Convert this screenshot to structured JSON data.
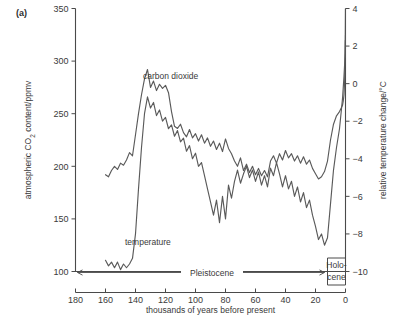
{
  "figure": {
    "panel_label": "(a)",
    "curve_labels": {
      "co2": "carbon dioxide",
      "temperature": "temperature"
    },
    "epochs": {
      "pleistocene": "Pleistocene",
      "holocene_line1": "Holo-",
      "holocene_line2": "cene"
    }
  },
  "chart_data": {
    "type": "line",
    "title": "",
    "xlabel": "thousands of years before present",
    "ylabel": "atmospheric CO2 content/ppmv",
    "y2label": "relative temperature change/°C",
    "xlim": [
      180,
      0
    ],
    "x_reversed": true,
    "ylim": [
      100,
      350
    ],
    "y2lim": [
      -10,
      4
    ],
    "grid": false,
    "legend_position": "inline-annotations",
    "xticks": [
      180,
      160,
      140,
      120,
      100,
      80,
      60,
      40,
      20,
      0
    ],
    "xticklabels": [
      "180",
      "160",
      "140",
      "120",
      "100",
      "80",
      "60",
      "40",
      "20",
      "0"
    ],
    "yticks": [
      100,
      150,
      200,
      250,
      300,
      350
    ],
    "yticklabels": [
      "100",
      "150",
      "200",
      "250",
      "300",
      "350"
    ],
    "y2ticks": [
      4,
      2,
      0,
      -2,
      -4,
      -6,
      -8,
      -10
    ],
    "y2ticklabels": [
      "4",
      "2",
      "0",
      "−2",
      "−4",
      "−6",
      "−8",
      "−10"
    ],
    "annotations": [
      {
        "text": "Pleistocene",
        "x_range": [
          178,
          12
        ],
        "type": "double-arrow-span"
      },
      {
        "text": "Holo-cene",
        "x_range": [
          12,
          0
        ],
        "type": "boxed-label"
      }
    ],
    "series": [
      {
        "name": "carbon dioxide",
        "axis": "left",
        "units": "ppmv",
        "x": [
          160,
          158,
          156,
          154,
          152,
          150,
          148,
          146,
          144,
          142,
          140,
          138,
          136,
          134,
          132,
          130,
          128,
          126,
          124,
          122,
          120,
          118,
          116,
          114,
          112,
          110,
          108,
          106,
          104,
          102,
          100,
          98,
          96,
          94,
          92,
          90,
          88,
          86,
          84,
          82,
          80,
          78,
          76,
          74,
          72,
          70,
          68,
          66,
          64,
          62,
          60,
          58,
          56,
          54,
          52,
          50,
          48,
          46,
          44,
          42,
          40,
          38,
          36,
          34,
          32,
          30,
          28,
          26,
          24,
          22,
          20,
          18,
          16,
          14,
          12,
          10,
          8,
          6,
          4,
          3,
          2,
          1.5,
          1,
          0.6,
          0.3,
          0.15,
          0.05,
          0
        ],
        "y": [
          192,
          190,
          196,
          200,
          197,
          203,
          201,
          206,
          213,
          210,
          230,
          250,
          268,
          283,
          292,
          275,
          281,
          272,
          278,
          274,
          277,
          270,
          252,
          238,
          236,
          240,
          232,
          228,
          235,
          227,
          231,
          224,
          230,
          222,
          227,
          219,
          224,
          216,
          222,
          214,
          226,
          217,
          212,
          205,
          200,
          208,
          196,
          202,
          194,
          200,
          192,
          198,
          191,
          196,
          190,
          205,
          210,
          203,
          212,
          206,
          215,
          208,
          212,
          205,
          210,
          203,
          209,
          202,
          206,
          198,
          193,
          188,
          190,
          195,
          205,
          225,
          240,
          248,
          252,
          255,
          258,
          262,
          268,
          280,
          300,
          320,
          345,
          358
        ]
      },
      {
        "name": "temperature",
        "axis": "right",
        "units": "°C",
        "x": [
          160,
          158,
          156,
          154,
          152,
          150,
          148,
          146,
          144,
          142,
          140,
          138,
          136,
          134,
          132,
          130,
          128,
          126,
          124,
          122,
          120,
          118,
          116,
          114,
          112,
          110,
          108,
          106,
          104,
          102,
          100,
          98,
          96,
          94,
          92,
          90,
          88,
          86,
          84,
          82,
          80,
          78,
          76,
          74,
          72,
          70,
          68,
          66,
          64,
          62,
          60,
          58,
          56,
          54,
          52,
          50,
          48,
          46,
          44,
          42,
          40,
          38,
          36,
          34,
          32,
          30,
          28,
          26,
          24,
          22,
          20,
          18,
          16,
          14,
          12,
          10,
          8,
          6,
          4,
          3,
          2,
          1.5,
          1,
          0.6,
          0.3,
          0.15,
          0.05,
          0
        ],
        "y": [
          -9.4,
          -9.7,
          -9.5,
          -9.8,
          -9.5,
          -9.9,
          -9.6,
          -9.8,
          -9.6,
          -9.3,
          -8.0,
          -5.6,
          -3.4,
          -1.6,
          -0.7,
          -1.3,
          -1.0,
          -1.7,
          -1.4,
          -2.0,
          -1.8,
          -2.4,
          -2.2,
          -2.8,
          -2.5,
          -3.1,
          -2.9,
          -3.6,
          -3.3,
          -4.0,
          -3.7,
          -4.4,
          -4.2,
          -4.9,
          -5.6,
          -6.3,
          -7.0,
          -6.2,
          -7.4,
          -6.0,
          -7.2,
          -5.4,
          -6.1,
          -5.2,
          -4.6,
          -5.3,
          -4.8,
          -4.4,
          -5.0,
          -4.6,
          -5.2,
          -4.7,
          -5.4,
          -4.9,
          -5.5,
          -4.5,
          -4.9,
          -4.2,
          -4.8,
          -5.5,
          -4.9,
          -5.6,
          -5.2,
          -6.0,
          -5.5,
          -6.3,
          -5.8,
          -6.6,
          -6.2,
          -7.0,
          -7.6,
          -8.3,
          -8.0,
          -8.6,
          -8.2,
          -6.4,
          -4.6,
          -3.4,
          -2.4,
          -1.6,
          -0.8,
          -0.2,
          0.4,
          1.0,
          1.6,
          2.3,
          1.4,
          2.6
        ]
      }
    ]
  }
}
